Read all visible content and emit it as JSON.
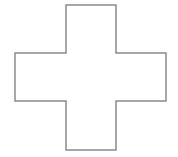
{
  "shape": {
    "type": "cross",
    "stroke_color": "#8a8a8a",
    "fill_color": "#ffffff",
    "points": "66,5 116,5 116,53 166,53 166,101 116,101 116,150 66,150 66,101 15,101 15,53 66,53"
  }
}
